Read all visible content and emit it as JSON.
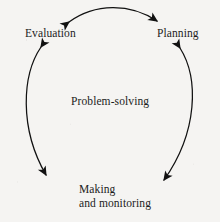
{
  "diagram": {
    "title_text": "Problem-solving",
    "background_color": "#f5f4f2",
    "stroke_color": "#111111",
    "nodes": [
      {
        "id": "evaluation",
        "label": "Evaluation"
      },
      {
        "id": "planning",
        "label": "Planning"
      },
      {
        "id": "making",
        "label_line1": "Making",
        "label_line2": "and monitoring"
      }
    ],
    "center": {
      "label": "Problem-solving"
    },
    "arrows": [
      {
        "id": "top-arc",
        "from": "Evaluation",
        "to": "Planning",
        "direction": "bidirectional"
      },
      {
        "id": "left-arc-up",
        "from": "Making and monitoring",
        "to": "Evaluation",
        "direction": "single"
      },
      {
        "id": "left-arc-down",
        "from": "Evaluation",
        "to": "Making and monitoring",
        "direction": "single"
      },
      {
        "id": "right-arc-up",
        "from": "Making and monitoring",
        "to": "Planning",
        "direction": "single"
      },
      {
        "id": "right-arc-down",
        "from": "Planning",
        "to": "Making and monitoring",
        "direction": "single"
      }
    ]
  }
}
